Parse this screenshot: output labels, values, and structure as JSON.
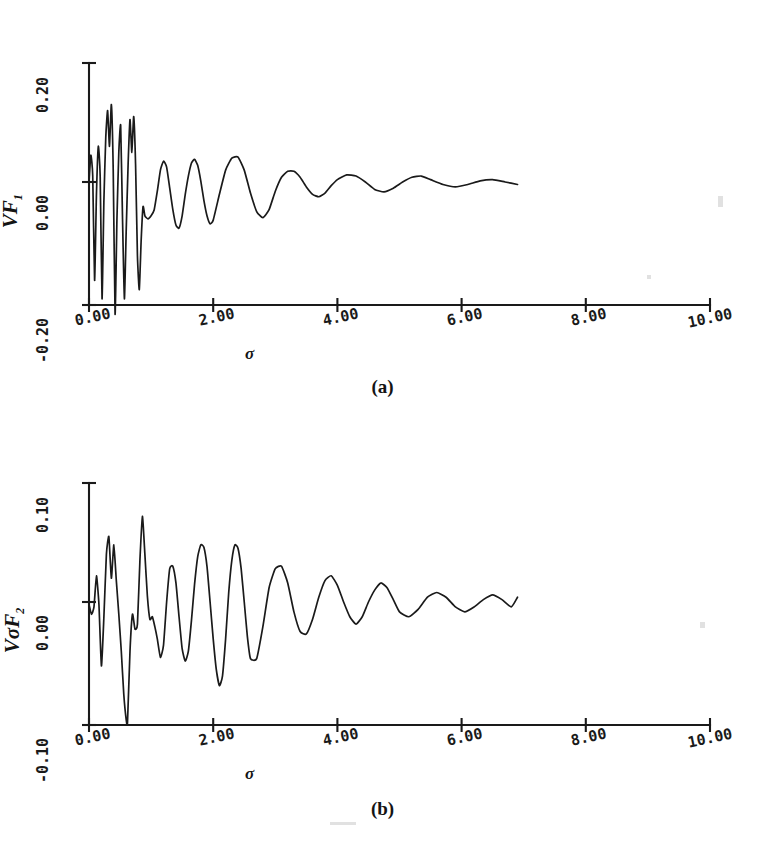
{
  "figure": {
    "background": "#ffffff",
    "ink_color": "#1a1a1a"
  },
  "panels": [
    {
      "id": "a",
      "caption": "(a)",
      "ylabel_v": "V",
      "ylabel_f": "F",
      "ylabel_sub": "1",
      "xlabel": "σ",
      "yticks": [
        "0.20",
        "0.00",
        "-0.20"
      ],
      "xticks": [
        "0.00",
        "2.00",
        "4.00",
        "6.00",
        "8.00",
        "10.00"
      ]
    },
    {
      "id": "b",
      "caption": "(b)",
      "ylabel_v": "Vσ",
      "ylabel_f": "F",
      "ylabel_sub": "2",
      "xlabel": "σ",
      "yticks": [
        "0.10",
        "0.00",
        "-0.10"
      ],
      "xticks": [
        "0.00",
        "2.00",
        "4.00",
        "6.00",
        "8.00",
        "10.00"
      ]
    }
  ],
  "chart_data": [
    {
      "type": "line",
      "title": "(a)",
      "xlabel": "σ",
      "ylabel": "VF_1",
      "xlim": [
        0,
        10
      ],
      "ylim": [
        -0.2,
        0.2
      ],
      "xticks": [
        0,
        2,
        4,
        6,
        8,
        10
      ],
      "yticks": [
        -0.2,
        0.0,
        0.2
      ],
      "grid": false,
      "legend": "none",
      "description": "Strongly damped oscillatory curve; large irregular oscillations for sigma < 1, decaying to near zero by sigma = 6.9 where the trace ends.",
      "series": [
        {
          "name": "VF1",
          "x": [
            0.0,
            0.03,
            0.06,
            0.09,
            0.12,
            0.15,
            0.18,
            0.21,
            0.24,
            0.27,
            0.3,
            0.33,
            0.36,
            0.39,
            0.42,
            0.45,
            0.48,
            0.51,
            0.54,
            0.57,
            0.6,
            0.63,
            0.66,
            0.69,
            0.72,
            0.75,
            0.78,
            0.81,
            0.84,
            0.87,
            0.9,
            0.95,
            1.0,
            1.05,
            1.1,
            1.15,
            1.2,
            1.25,
            1.3,
            1.35,
            1.4,
            1.45,
            1.5,
            1.55,
            1.6,
            1.65,
            1.7,
            1.75,
            1.8,
            1.85,
            1.9,
            1.95,
            2.0,
            2.1,
            2.2,
            2.3,
            2.4,
            2.5,
            2.6,
            2.7,
            2.8,
            2.9,
            3.0,
            3.1,
            3.2,
            3.3,
            3.4,
            3.5,
            3.6,
            3.7,
            3.8,
            3.9,
            4.0,
            4.15,
            4.3,
            4.45,
            4.6,
            4.75,
            4.9,
            5.05,
            5.2,
            5.35,
            5.5,
            5.7,
            5.9,
            6.1,
            6.3,
            6.5,
            6.7,
            6.9
          ],
          "y": [
            0.0,
            0.045,
            0.01,
            -0.16,
            -0.02,
            0.06,
            0.01,
            -0.19,
            -0.03,
            0.075,
            0.12,
            0.06,
            0.13,
            0.02,
            -0.215,
            -0.06,
            0.05,
            0.095,
            -0.06,
            -0.19,
            -0.075,
            0.03,
            0.105,
            0.05,
            0.11,
            0.03,
            -0.12,
            -0.175,
            -0.095,
            -0.04,
            -0.055,
            -0.06,
            -0.055,
            -0.045,
            -0.015,
            0.02,
            0.035,
            0.025,
            -0.01,
            -0.045,
            -0.07,
            -0.075,
            -0.055,
            -0.02,
            0.01,
            0.032,
            0.038,
            0.028,
            0.002,
            -0.03,
            -0.055,
            -0.068,
            -0.062,
            -0.02,
            0.02,
            0.04,
            0.042,
            0.02,
            -0.018,
            -0.048,
            -0.058,
            -0.045,
            -0.015,
            0.008,
            0.018,
            0.018,
            0.008,
            -0.008,
            -0.02,
            -0.024,
            -0.018,
            -0.006,
            0.004,
            0.012,
            0.01,
            0.0,
            -0.012,
            -0.016,
            -0.01,
            0.0,
            0.008,
            0.01,
            0.004,
            -0.004,
            -0.008,
            -0.004,
            0.002,
            0.004,
            0.0,
            -0.004,
            -0.002
          ]
        }
      ]
    },
    {
      "type": "line",
      "title": "(b)",
      "xlabel": "σ",
      "ylabel": "VσF_2",
      "xlim": [
        0,
        10
      ],
      "ylim": [
        -0.1,
        0.1
      ],
      "xticks": [
        0,
        2,
        4,
        6,
        8,
        10
      ],
      "yticks": [
        -0.1,
        0.0,
        0.1
      ],
      "grid": false,
      "legend": "none",
      "description": "Damped oscillatory curve with a deep minimum near sigma = 0.62 reaching about -0.098 and a tall peak near sigma = 0.85; oscillations decay and the trace ends near sigma = 6.9.",
      "series": [
        {
          "name": "VsigmaF2",
          "x": [
            0.0,
            0.04,
            0.08,
            0.12,
            0.16,
            0.2,
            0.24,
            0.28,
            0.32,
            0.36,
            0.4,
            0.44,
            0.48,
            0.52,
            0.56,
            0.6,
            0.62,
            0.66,
            0.7,
            0.74,
            0.78,
            0.82,
            0.86,
            0.9,
            0.94,
            0.98,
            1.02,
            1.06,
            1.1,
            1.15,
            1.2,
            1.25,
            1.3,
            1.35,
            1.4,
            1.45,
            1.5,
            1.55,
            1.6,
            1.65,
            1.7,
            1.75,
            1.8,
            1.85,
            1.9,
            1.95,
            2.0,
            2.05,
            2.1,
            2.15,
            2.2,
            2.25,
            2.3,
            2.35,
            2.4,
            2.45,
            2.5,
            2.55,
            2.6,
            2.7,
            2.8,
            2.9,
            3.0,
            3.1,
            3.2,
            3.3,
            3.4,
            3.5,
            3.6,
            3.7,
            3.8,
            3.9,
            4.0,
            4.1,
            4.2,
            4.3,
            4.4,
            4.5,
            4.6,
            4.7,
            4.8,
            4.9,
            5.0,
            5.15,
            5.3,
            5.45,
            5.6,
            5.75,
            5.9,
            6.05,
            6.2,
            6.35,
            6.5,
            6.65,
            6.8,
            6.9
          ],
          "y": [
            -0.002,
            -0.01,
            -0.004,
            0.022,
            -0.002,
            -0.052,
            -0.012,
            0.04,
            0.055,
            0.02,
            0.048,
            0.018,
            -0.01,
            -0.04,
            -0.075,
            -0.096,
            -0.098,
            -0.04,
            -0.01,
            -0.022,
            -0.018,
            0.035,
            0.072,
            0.04,
            0.005,
            -0.014,
            -0.012,
            -0.02,
            -0.03,
            -0.045,
            -0.035,
            0.0,
            0.028,
            0.03,
            0.016,
            -0.012,
            -0.038,
            -0.048,
            -0.04,
            -0.015,
            0.015,
            0.038,
            0.048,
            0.046,
            0.03,
            0.0,
            -0.03,
            -0.055,
            -0.068,
            -0.06,
            -0.03,
            0.008,
            0.035,
            0.048,
            0.045,
            0.028,
            0.0,
            -0.028,
            -0.046,
            -0.046,
            -0.02,
            0.012,
            0.028,
            0.03,
            0.016,
            -0.008,
            -0.024,
            -0.026,
            -0.014,
            0.004,
            0.018,
            0.022,
            0.014,
            0.0,
            -0.012,
            -0.018,
            -0.012,
            0.0,
            0.01,
            0.016,
            0.012,
            0.002,
            -0.008,
            -0.012,
            -0.006,
            0.004,
            0.008,
            0.004,
            -0.004,
            -0.008,
            -0.004,
            0.002,
            0.006,
            0.002,
            -0.004,
            0.004,
            0.01
          ]
        }
      ]
    }
  ]
}
